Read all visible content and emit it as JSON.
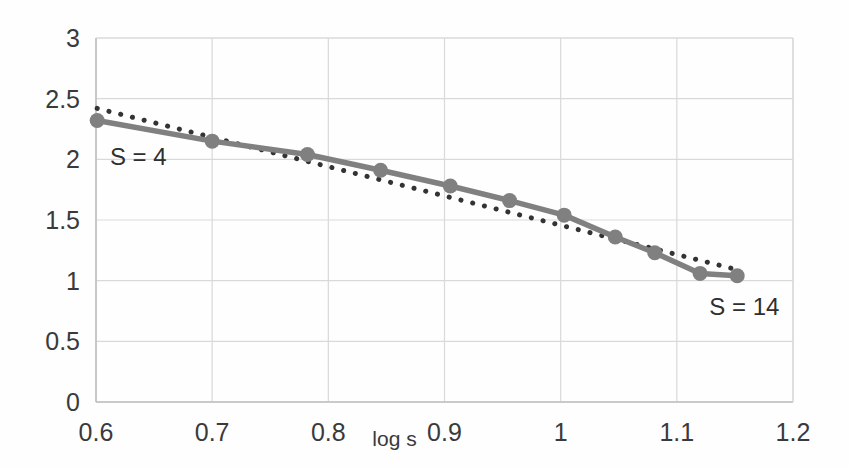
{
  "chart_data": {
    "type": "line",
    "title": "",
    "xlabel": "log s",
    "ylabel": "",
    "xlim": [
      0.6,
      1.2
    ],
    "ylim": [
      0,
      3
    ],
    "grid": true,
    "legend_position": "none",
    "x_ticks": [
      "0.6",
      "0.7",
      "0.8",
      "0.9",
      "1",
      "1.1",
      "1.2"
    ],
    "x_tick_values": [
      0.6,
      0.7,
      0.8,
      0.9,
      1.0,
      1.1,
      1.2
    ],
    "y_ticks": [
      "0",
      "0.5",
      "1",
      "1.5",
      "2",
      "2.5",
      "3"
    ],
    "y_tick_values": [
      0,
      0.5,
      1,
      1.5,
      2,
      2.5,
      3
    ],
    "series": [
      {
        "name": "data-series-solid",
        "style": "solid-with-round-markers",
        "color": "#808080",
        "x": [
          0.601,
          0.7,
          0.782,
          0.845,
          0.905,
          0.956,
          1.003,
          1.047,
          1.081,
          1.12,
          1.152
        ],
        "values": [
          2.32,
          2.15,
          2.04,
          1.91,
          1.78,
          1.66,
          1.54,
          1.36,
          1.23,
          1.06,
          1.04
        ]
      },
      {
        "name": "trendline-dotted",
        "style": "dotted",
        "color": "#333333",
        "x": [
          0.601,
          1.152
        ],
        "values": [
          2.42,
          1.09
        ]
      }
    ],
    "annotations": [
      {
        "text": "S = 4",
        "x": 0.612,
        "y": 2.12,
        "anchor": "start"
      },
      {
        "text": "S = 14",
        "x": 1.128,
        "y": 0.88,
        "anchor": "start"
      }
    ],
    "colors": {
      "series_line": "#808080",
      "marker": "#808080",
      "trendline": "#333333",
      "grid": "#d9d9d9",
      "axis": "#bfbfbf",
      "text": "#3a3a3a",
      "background": "#ffffff"
    }
  }
}
